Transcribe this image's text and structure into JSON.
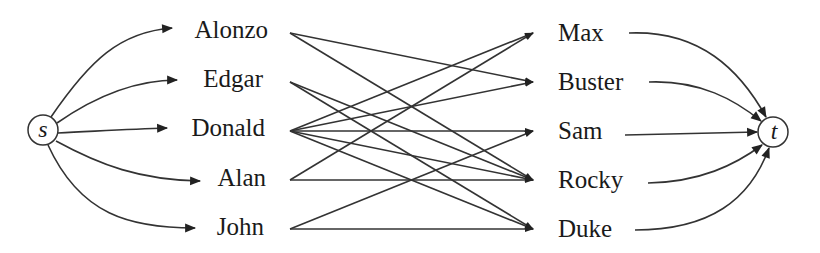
{
  "diagram": {
    "type": "bipartite-flow-network",
    "source": {
      "id": "s",
      "label": "s",
      "x": 43,
      "y": 130
    },
    "sink": {
      "id": "t",
      "label": "t",
      "x": 773,
      "y": 132
    },
    "left_nodes": [
      {
        "id": "alonzo",
        "label": "Alonzo",
        "y": 30
      },
      {
        "id": "edgar",
        "label": "Edgar",
        "y": 79
      },
      {
        "id": "donald",
        "label": "Donald",
        "y": 128
      },
      {
        "id": "alan",
        "label": "Alan",
        "y": 178
      },
      {
        "id": "john",
        "label": "John",
        "y": 227
      }
    ],
    "right_nodes": [
      {
        "id": "max",
        "label": "Max",
        "y": 33
      },
      {
        "id": "buster",
        "label": "Buster",
        "y": 82
      },
      {
        "id": "sam",
        "label": "Sam",
        "y": 131
      },
      {
        "id": "rocky",
        "label": "Rocky",
        "y": 180
      },
      {
        "id": "duke",
        "label": "Duke",
        "y": 229
      }
    ],
    "edges": [
      {
        "from": "Alonzo",
        "to": "Buster"
      },
      {
        "from": "Alonzo",
        "to": "Rocky"
      },
      {
        "from": "Edgar",
        "to": "Rocky"
      },
      {
        "from": "Edgar",
        "to": "Duke"
      },
      {
        "from": "Donald",
        "to": "Max"
      },
      {
        "from": "Donald",
        "to": "Buster"
      },
      {
        "from": "Donald",
        "to": "Sam"
      },
      {
        "from": "Donald",
        "to": "Rocky"
      },
      {
        "from": "Donald",
        "to": "Duke"
      },
      {
        "from": "Alan",
        "to": "Max"
      },
      {
        "from": "Alan",
        "to": "Rocky"
      },
      {
        "from": "John",
        "to": "Sam"
      },
      {
        "from": "John",
        "to": "Duke"
      }
    ],
    "edge_color": "#333333"
  }
}
